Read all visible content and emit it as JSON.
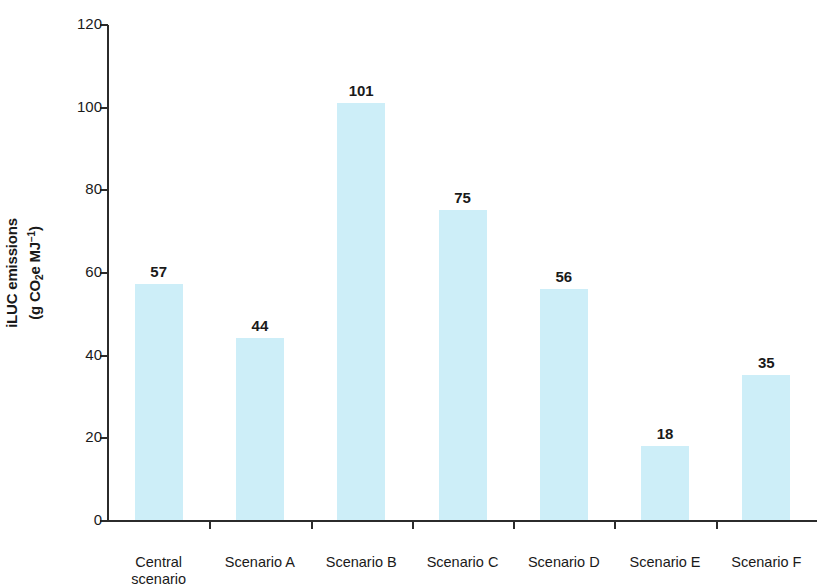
{
  "chart_data": {
    "type": "bar",
    "title": "",
    "subtitle": "",
    "xlabel": "",
    "ylabel": "iLUC emissions (g CO2e MJ-1)",
    "ylabel_line1": "iLUC emissions",
    "ylabel_line2_pre": "(g CO",
    "ylabel_line2_sub": "2",
    "ylabel_line2_mid": "e MJ",
    "ylabel_line2_sup": "−1",
    "ylabel_line2_post": ")",
    "categories": [
      "Central scenario",
      "Scenario A",
      "Scenario B",
      "Scenario C",
      "Scenario D",
      "Scenario E",
      "Scenario F"
    ],
    "category_lines": [
      [
        "Central",
        "scenario"
      ],
      [
        "Scenario A"
      ],
      [
        "Scenario B"
      ],
      [
        "Scenario C"
      ],
      [
        "Scenario D"
      ],
      [
        "Scenario E"
      ],
      [
        "Scenario F"
      ]
    ],
    "values": [
      57,
      44,
      101,
      75,
      56,
      18,
      35
    ],
    "value_labels": [
      "57",
      "44",
      "101",
      "75",
      "56",
      "18",
      "35"
    ],
    "ylim": [
      0,
      120
    ],
    "yticks": [
      0,
      20,
      40,
      60,
      80,
      100,
      120
    ],
    "ytick_labels": [
      "0",
      "20",
      "40",
      "60",
      "80",
      "100",
      "120"
    ],
    "grid": false,
    "legend": false,
    "legend_position": "none",
    "bar_color": "#cdeef8",
    "axis_color": "#2b2b2b",
    "text_color": "#1a1a1a",
    "background_color": "#ffffff"
  }
}
